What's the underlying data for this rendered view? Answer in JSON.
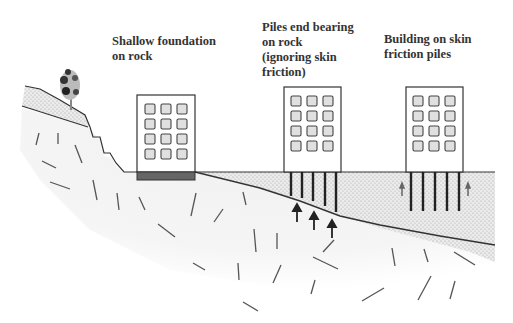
{
  "diagram": {
    "type": "foundation-types-illustration",
    "labels": {
      "shallow": [
        "Shallow foundation",
        "on rock"
      ],
      "end_bearing": [
        "Piles end bearing",
        "on rock",
        "(ignoring skin",
        "friction)"
      ],
      "skin_friction": [
        "Building on skin",
        "friction piles"
      ]
    },
    "elements": [
      {
        "name": "building-shallow-foundation",
        "windows": "3x4",
        "foundation": "shallow dark strip on rock"
      },
      {
        "name": "building-end-bearing-piles",
        "windows": "3x4",
        "piles": 5,
        "arrows_up": 3
      },
      {
        "name": "building-skin-friction-piles",
        "windows": "3x4",
        "piles": 5,
        "arrows_side": 2
      }
    ],
    "layers": {
      "soil": "dotted stippled layer",
      "rock": "light grey with dash marks",
      "tree": "on slope at left"
    },
    "colors": {
      "ink": "#333333",
      "rock_fill": "#f3f3f3",
      "soil_fill": "#e6e6e6",
      "foundation": "#666666"
    }
  }
}
